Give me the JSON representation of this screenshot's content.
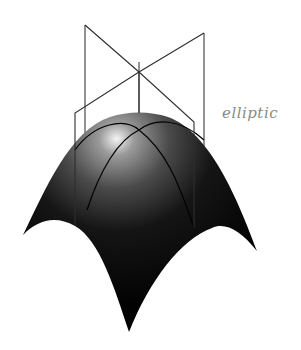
{
  "diagram": {
    "label": "elliptic",
    "colors": {
      "background": "#ffffff",
      "surface_dark": "#050505",
      "surface_highlight": "#e8e8e8",
      "frame_lines": "#333333",
      "label": "#8a8a8a"
    },
    "description_parts": [
      "elliptic surface (dome)",
      "two intersecting vertical planes",
      "vertical axis"
    ]
  }
}
